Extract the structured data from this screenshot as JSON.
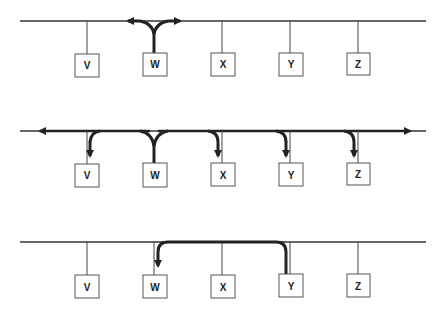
{
  "panels": [
    {
      "id": "broadcast-start",
      "description": "Station W transmits; signal propagates both directions on bus",
      "bus_y": 21,
      "stations": [
        {
          "label": "V",
          "x": 87
        },
        {
          "label": "W",
          "x": 154
        },
        {
          "label": "X",
          "x": 222
        },
        {
          "label": "Y",
          "x": 290
        },
        {
          "label": "Z",
          "x": 358
        }
      ]
    },
    {
      "id": "broadcast-propagated",
      "description": "Signal from W reaches all stations V, X, Y, Z",
      "bus_y": 131,
      "stations": [
        {
          "label": "V",
          "x": 87
        },
        {
          "label": "W",
          "x": 154
        },
        {
          "label": "X",
          "x": 222
        },
        {
          "label": "Y",
          "x": 290
        },
        {
          "label": "Z",
          "x": 358
        }
      ]
    },
    {
      "id": "reply",
      "description": "Station Y sends to station W",
      "bus_y": 242,
      "stations": [
        {
          "label": "V",
          "x": 87
        },
        {
          "label": "W",
          "x": 154
        },
        {
          "label": "X",
          "x": 222
        },
        {
          "label": "Y",
          "x": 290
        },
        {
          "label": "Z",
          "x": 358
        }
      ]
    }
  ],
  "labels": {
    "p0": [
      "V",
      "W",
      "X",
      "Y",
      "Z"
    ],
    "p1": [
      "V",
      "W",
      "X",
      "Y",
      "Z"
    ],
    "p2": [
      "V",
      "W",
      "X",
      "Y",
      "Z"
    ]
  },
  "colors": {
    "line": "#333333",
    "signal": "#222222"
  }
}
